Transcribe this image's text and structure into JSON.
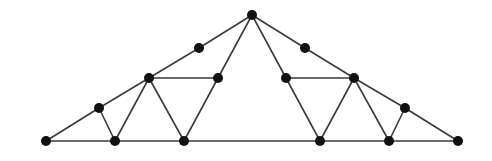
{
  "diagram": {
    "type": "roof-truss",
    "colors": {
      "member": "#3a3a3a",
      "joint": "#111111",
      "background": "#ffffff"
    },
    "joint_radius": 5,
    "nodes": [
      {
        "id": "A",
        "x": 46,
        "y": 141
      },
      {
        "id": "B",
        "x": 99,
        "y": 108
      },
      {
        "id": "C",
        "x": 149,
        "y": 78
      },
      {
        "id": "D",
        "x": 199,
        "y": 48
      },
      {
        "id": "E",
        "x": 252,
        "y": 15
      },
      {
        "id": "F",
        "x": 305,
        "y": 48
      },
      {
        "id": "G",
        "x": 354,
        "y": 78
      },
      {
        "id": "H",
        "x": 405,
        "y": 108
      },
      {
        "id": "I",
        "x": 458,
        "y": 141
      },
      {
        "id": "J",
        "x": 115,
        "y": 141
      },
      {
        "id": "K",
        "x": 184,
        "y": 141
      },
      {
        "id": "L",
        "x": 320,
        "y": 141
      },
      {
        "id": "M",
        "x": 389,
        "y": 141
      },
      {
        "id": "N",
        "x": 218,
        "y": 78
      },
      {
        "id": "O",
        "x": 286,
        "y": 78
      }
    ],
    "edges": [
      [
        "A",
        "B"
      ],
      [
        "B",
        "C"
      ],
      [
        "C",
        "D"
      ],
      [
        "D",
        "E"
      ],
      [
        "E",
        "F"
      ],
      [
        "F",
        "G"
      ],
      [
        "G",
        "H"
      ],
      [
        "H",
        "I"
      ],
      [
        "A",
        "I"
      ],
      [
        "B",
        "J"
      ],
      [
        "C",
        "J"
      ],
      [
        "C",
        "K"
      ],
      [
        "C",
        "N"
      ],
      [
        "N",
        "K"
      ],
      [
        "N",
        "E"
      ],
      [
        "E",
        "O"
      ],
      [
        "O",
        "L"
      ],
      [
        "O",
        "G"
      ],
      [
        "G",
        "L"
      ],
      [
        "G",
        "M"
      ],
      [
        "H",
        "M"
      ]
    ]
  }
}
